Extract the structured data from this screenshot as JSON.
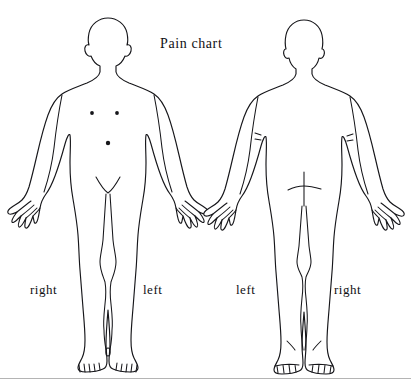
{
  "chart": {
    "title": "Pain chart",
    "title_position": {
      "x": 160,
      "y": 48
    }
  },
  "figures": [
    {
      "id": "anterior",
      "view_name": "anterior-body-figure",
      "labels": {
        "left_side": "right",
        "right_side": "left"
      },
      "markers": [
        {
          "name": "nipple-left",
          "x": 92,
          "y": 113
        },
        {
          "name": "nipple-right",
          "x": 117,
          "y": 113
        },
        {
          "name": "navel",
          "x": 108,
          "y": 143
        }
      ]
    },
    {
      "id": "posterior",
      "view_name": "posterior-body-figure",
      "labels": {
        "left_side": "left",
        "right_side": "right"
      },
      "markers": [
        {
          "name": "elbow-crease-left",
          "x": 258,
          "y": 136
        },
        {
          "name": "elbow-crease-right",
          "x": 350,
          "y": 137
        },
        {
          "name": "gluteal-cross",
          "x": 304,
          "y": 188
        }
      ]
    }
  ],
  "side_labels": {
    "anterior_left": {
      "text": "right",
      "x": 30,
      "y": 294
    },
    "anterior_right": {
      "text": "left",
      "x": 143,
      "y": 294
    },
    "posterior_left": {
      "text": "left",
      "x": 236,
      "y": 294
    },
    "posterior_right": {
      "text": "right",
      "x": 334,
      "y": 294
    }
  },
  "colors": {
    "background": "#ffffff",
    "outline": "#16161a",
    "text": "#101014",
    "rule": "#b4b4b4"
  }
}
